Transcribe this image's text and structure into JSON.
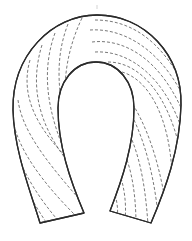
{
  "figure": {
    "line_color": "#2b2b2b",
    "hatch_color": "#555555",
    "background": "#ffffff",
    "hatch_style": "dashed"
  }
}
